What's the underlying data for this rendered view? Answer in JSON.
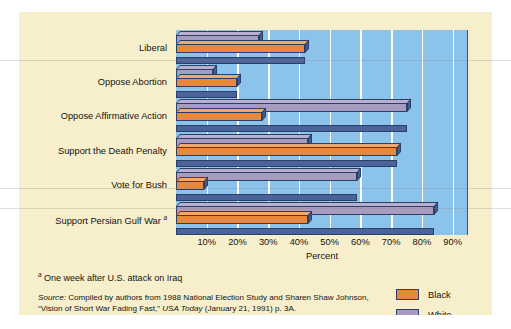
{
  "chart_data": {
    "type": "bar",
    "orientation": "horizontal",
    "title": "",
    "xlabel": "Percent",
    "ylabel": "",
    "xlim": [
      0,
      95
    ],
    "xticks": [
      "10%",
      "20%",
      "30%",
      "40%",
      "50%",
      "60%",
      "70%",
      "80%",
      "90%"
    ],
    "xtick_values": [
      10,
      20,
      30,
      40,
      50,
      60,
      70,
      80,
      90
    ],
    "grid": "vertical-white-gridlines",
    "legend_position": "bottom-right",
    "categories": [
      "Liberal",
      "Oppose Abortion",
      "Oppose Affirmative Action",
      "Support the Death Penalty",
      "Vote for Bush",
      "Support Persian Gulf War"
    ],
    "category_footnote_marks": [
      "",
      "",
      "",
      "",
      "",
      "a"
    ],
    "series": [
      {
        "name": "Black",
        "color": "#e8883f",
        "values": [
          42,
          20,
          28,
          72,
          9,
          43
        ]
      },
      {
        "name": "White",
        "color": "#a79bc0",
        "values": [
          27,
          12,
          75,
          43,
          59,
          84
        ]
      }
    ]
  },
  "axis": {
    "x_title": "Percent",
    "ticks": [
      "10%",
      "20%",
      "30%",
      "40%",
      "50%",
      "60%",
      "70%",
      "80%",
      "90%"
    ]
  },
  "categories": [
    {
      "label": "Liberal",
      "mark": ""
    },
    {
      "label": "Oppose Abortion",
      "mark": ""
    },
    {
      "label": "Oppose Affirmative Action",
      "mark": ""
    },
    {
      "label": "Support the Death Penalty",
      "mark": ""
    },
    {
      "label": "Vote for Bush",
      "mark": ""
    },
    {
      "label": "Support Persian Gulf War ",
      "mark": "a"
    }
  ],
  "legend": {
    "items": [
      {
        "label": "Black",
        "color": "#e8883f"
      },
      {
        "label": "White",
        "color": "#a79bc0"
      }
    ]
  },
  "notes": {
    "footnote_mark": "a",
    "footnote_text": "One week after U.S. attack on Iraq",
    "source_prefix": "Source:",
    "source_part1": " Compiled by authors from 1988 National Election Study and Sharen Shaw Johnson, “Vision of Short War Fading Fast,” ",
    "source_italic": "USA Today",
    "source_part2": " (January 21, 1991) p. 3A."
  },
  "colors": {
    "figure_background": "#f7efcc",
    "plot_background": "#8cc3ea",
    "gridline": "#ffffff",
    "bar_black": "#e8883f",
    "bar_white": "#a79bc0",
    "bar_shadow": "#4a639a",
    "outline": "#2c3f66"
  }
}
